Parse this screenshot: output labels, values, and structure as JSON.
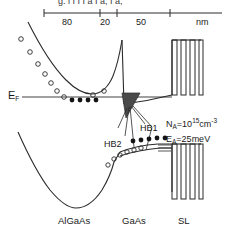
{
  "figure": {
    "type": "band-diagram",
    "caption_cut_off": "g.              l  I  I  I   a  I a,  I a,",
    "scale": {
      "unit_label": "nm",
      "segments": [
        {
          "label": "80"
        },
        {
          "label": "20"
        },
        {
          "label": "50"
        }
      ]
    },
    "axis_labels": {
      "energy_fermi": "E",
      "energy_fermi_sub": "F"
    },
    "regions": [
      {
        "name": "AlGaAs",
        "label": "AlGaAs"
      },
      {
        "name": "GaAs",
        "label": "GaAs"
      },
      {
        "name": "SL",
        "label": "SL"
      }
    ],
    "annotations": [
      {
        "name": "hb1",
        "label": "HB1"
      },
      {
        "name": "hb2",
        "label": "HB2"
      }
    ],
    "parameters": [
      {
        "name": "acceptor-concentration",
        "symbol": "N",
        "symbol_sub": "A",
        "eq": "=10",
        "exp": "15",
        "unit": "cm",
        "unit_exp": "-3"
      },
      {
        "name": "acceptor-energy",
        "symbol": "E",
        "symbol_sub": "A",
        "eq": "=25meV",
        "exp": "",
        "unit": "",
        "unit_exp": ""
      }
    ],
    "colors": {
      "line": "#2b2b2b",
      "fill_dark": "#3a3a3a",
      "background": "#ffffff"
    },
    "carriers": {
      "open_circles_label": "holes-open-circles",
      "filled_dots_label": "carriers-filled-dots"
    }
  }
}
